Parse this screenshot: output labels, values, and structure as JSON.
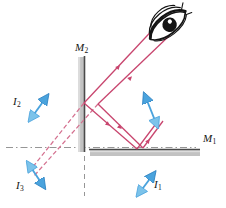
{
  "figure": {
    "type": "optics-ray-diagram",
    "background_color": "#ffffff"
  },
  "colors": {
    "ray": "#c8456e",
    "ray_dashed": "#d4708f",
    "image_arrow": "#4aa3dd",
    "image_arrow_dark": "#2a7fc0",
    "mirror_edge": "#4a4a4a",
    "mirror_band": "#b5b5b5",
    "construction_line": "#8a8a8a",
    "eye_outline": "#141414",
    "label_text": "#141414"
  },
  "labels": {
    "mirror_1": {
      "base": "M",
      "sub": "1",
      "x": 203,
      "y": 139
    },
    "mirror_2": {
      "base": "M",
      "sub": "2",
      "x": 75,
      "y": 48
    },
    "image_1": {
      "base": "I",
      "sub": "1",
      "x": 153,
      "y": 185
    },
    "image_2": {
      "base": "I",
      "sub": "2",
      "x": 14,
      "y": 100
    },
    "image_3": {
      "base": "I",
      "sub": "3",
      "x": 19,
      "y": 186
    }
  },
  "mirrors": [
    {
      "name": "M1",
      "orientation": "horizontal",
      "x1": 90,
      "y1": 150,
      "x2": 200,
      "y2": 150,
      "thickness": 6
    },
    {
      "name": "M2",
      "orientation": "vertical",
      "x1": 84,
      "y1": 57,
      "x2": 84,
      "y2": 152,
      "thickness": 6
    }
  ],
  "construction_lines": [
    {
      "name": "horizontal-axis-dashdot",
      "x1": 6,
      "y1": 147,
      "x2": 196,
      "y2": 147
    },
    {
      "name": "vertical-axis-dashed",
      "x1": 84,
      "y1": 57,
      "x2": 84,
      "y2": 196
    }
  ],
  "eye": {
    "x": 168,
    "y": 26,
    "rotation": -38
  },
  "image_arrows": [
    {
      "name": "I1-arrow",
      "x1": 140,
      "y1": 192,
      "x2": 152,
      "y2": 176,
      "double": true
    },
    {
      "name": "I2-arrow",
      "x1": 32,
      "y1": 117,
      "x2": 45,
      "y2": 99,
      "double": true
    },
    {
      "name": "I3-arrow",
      "x1": 30,
      "y1": 166,
      "x2": 42,
      "y2": 184,
      "double": true
    },
    {
      "name": "object-arrow",
      "x1": 155,
      "y1": 122,
      "x2": 146,
      "y2": 98,
      "double": true
    }
  ],
  "rays": {
    "solid_count": 6,
    "dashed_count": 2,
    "note": "Rays travel from object region, reflect off M1 and M2, and reach the eye"
  }
}
